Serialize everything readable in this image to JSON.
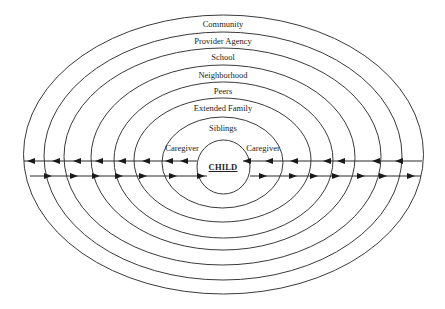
{
  "diagram": {
    "center": {
      "label": "CHILD",
      "x": 223,
      "y": 167
    },
    "rings": [
      {
        "id": "child",
        "label": "CHILD",
        "cx": 223.5,
        "cy": 167,
        "rx": 26.5,
        "ry": 27
      },
      {
        "id": "caregiver",
        "label": "Caregiver",
        "cx": 222.5,
        "cy": 162.5,
        "rx": 60.5,
        "ry": 45.5
      },
      {
        "id": "siblings",
        "label": "Siblings",
        "cx": 222.5,
        "cy": 160,
        "rx": 88.5,
        "ry": 62
      },
      {
        "id": "extended-family",
        "label": "Extended Family",
        "cx": 223.5,
        "cy": 160,
        "rx": 109.5,
        "ry": 78
      },
      {
        "id": "peers",
        "label": "Peers",
        "cx": 223,
        "cy": 157.5,
        "rx": 132,
        "ry": 92.5
      },
      {
        "id": "neighborhood",
        "label": "Neighborhood",
        "cx": 222.5,
        "cy": 156.5,
        "rx": 158.5,
        "ry": 108.5
      },
      {
        "id": "school",
        "label": "School",
        "cx": 223,
        "cy": 156,
        "rx": 179,
        "ry": 124
      },
      {
        "id": "community",
        "label": "Community",
        "cx": 223.5,
        "cy": 154.5,
        "rx": 200,
        "ry": 139.5
      }
    ],
    "labels": [
      {
        "id": "community",
        "text": "Community",
        "x": 223,
        "y": 20
      },
      {
        "id": "provider-agency",
        "text": "Provider Agency",
        "x": 223,
        "y": 37
      },
      {
        "id": "school",
        "text": "School",
        "x": 223,
        "y": 53
      },
      {
        "id": "neighborhood",
        "text": "Neighborhood",
        "x": 223,
        "y": 71
      },
      {
        "id": "peers",
        "text": "Peers",
        "x": 223,
        "y": 87
      },
      {
        "id": "extended-family",
        "text": "Extended Family",
        "x": 223,
        "y": 104
      },
      {
        "id": "siblings",
        "text": "Siblings",
        "x": 223,
        "y": 124
      },
      {
        "id": "caregiver-left",
        "text": "Caregiver",
        "x": 182,
        "y": 144
      },
      {
        "id": "caregiver-right",
        "text": "Caregiver",
        "x": 263,
        "y": 144
      },
      {
        "id": "child",
        "text": "CHILD",
        "x": 223,
        "y": 163
      }
    ],
    "flows": {
      "inward_line_y": 161,
      "outward_line_y": 176,
      "left_inward": {
        "x1": 24,
        "x2": 197,
        "arrowheads_x": [
          27,
          52,
          73,
          95,
          118,
          142,
          165,
          180
        ],
        "direction": "left"
      },
      "left_outward": {
        "x1": 30,
        "x2": 207,
        "arrowheads_x": [
          52,
          78,
          100,
          123,
          147,
          177,
          205
        ],
        "direction": "right"
      },
      "right_inward": {
        "x1": 243,
        "x2": 422,
        "arrowheads_x": [
          243,
          265,
          290,
          323,
          337,
          372,
          395
        ],
        "direction": "left"
      },
      "right_outward": {
        "x1": 250,
        "x2": 421,
        "arrowheads_x": [
          267,
          297,
          318,
          340,
          365,
          387,
          415
        ],
        "direction": "right"
      }
    },
    "colors": {
      "stroke": "#3a3a3a",
      "arrow": "#1a1a1a",
      "text": "#222222",
      "background": "#ffffff"
    }
  }
}
